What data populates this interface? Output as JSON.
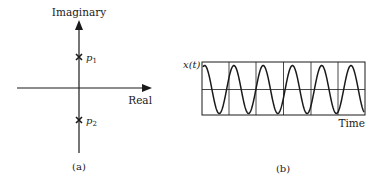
{
  "panel_a": {
    "y_axis_label": "Imaginary",
    "x_axis_label": "Real",
    "poles": [
      {
        "label": "p",
        "subscript": "1",
        "position": "upper"
      },
      {
        "label": "p",
        "subscript": "2",
        "position": "lower"
      }
    ],
    "caption": "(a)"
  },
  "panel_b": {
    "y_axis_label": "x(t)",
    "x_axis_label": "Time",
    "grid_columns": 6,
    "grid_rows": 2,
    "waveform": "sinusoid",
    "cycles": 5.5,
    "caption": "(b)"
  },
  "colors": {
    "ink": "#1a1a1a",
    "background": "#ffffff"
  }
}
